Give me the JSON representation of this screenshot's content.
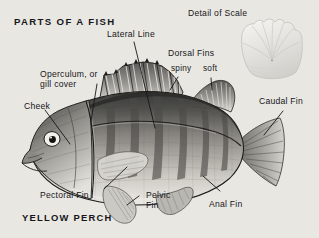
{
  "figure": {
    "title": "PARTS OF A FISH",
    "species_caption": "YELLOW PERCH",
    "inset_title": "Detail of Scale",
    "background_color": "#e9e7e2",
    "ink_color": "#16161a",
    "medium": "grayscale halftone illustration"
  },
  "labels": {
    "lateral_line": "Lateral Line",
    "operculum_line1": "Operculum, or",
    "operculum_line2": "gill cover",
    "cheek": "Cheek",
    "dorsal_fins": "Dorsal Fins",
    "dorsal_spiny": "spiny",
    "dorsal_soft": "soft",
    "caudal_fin": "Caudal Fin",
    "pectoral_fin": "Pectoral Fin",
    "pelvic_fin_line1": "Pelvic",
    "pelvic_fin_line2": "Fin",
    "anal_fin": "Anal Fin"
  },
  "inset": {
    "name": "ctenoid-scale-detail",
    "label": "Detail of Scale"
  },
  "illustration": {
    "subject": "yellow perch (Perca flavescens), left lateral view, head facing left",
    "parts": [
      "spiny dorsal fin",
      "soft dorsal fin",
      "caudal fin",
      "anal fin",
      "pelvic fin",
      "pectoral fin",
      "operculum",
      "cheek",
      "lateral line",
      "eye",
      "mouth",
      "vertical bars on flank"
    ]
  }
}
